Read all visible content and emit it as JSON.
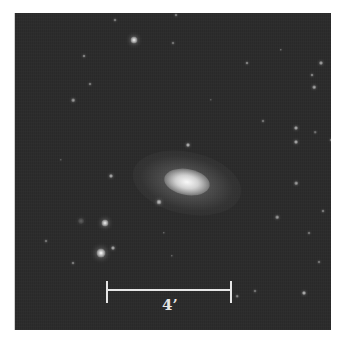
{
  "image": {
    "subject": "galaxy",
    "background_color": "#2b2b2b",
    "border_color": "#ffffff"
  },
  "scale_bar": {
    "label": "4’",
    "color": "#e6e6e6"
  },
  "galaxy": {
    "center": [
      172,
      170
    ]
  },
  "stars": [
    {
      "x": 133,
      "y": 40,
      "r": 3.5,
      "b": 0.95
    },
    {
      "x": 104,
      "y": 223,
      "r": 3.5,
      "b": 0.95
    },
    {
      "x": 100,
      "y": 253,
      "r": 4.5,
      "b": 1.0
    },
    {
      "x": 112,
      "y": 248,
      "r": 2,
      "b": 0.7
    },
    {
      "x": 158,
      "y": 202,
      "r": 2.5,
      "b": 0.85
    },
    {
      "x": 187,
      "y": 145,
      "r": 2,
      "b": 0.75
    },
    {
      "x": 114,
      "y": 20,
      "r": 1.5,
      "b": 0.5
    },
    {
      "x": 175,
      "y": 15,
      "r": 1.5,
      "b": 0.5
    },
    {
      "x": 172,
      "y": 43,
      "r": 1.5,
      "b": 0.45
    },
    {
      "x": 83,
      "y": 56,
      "r": 1.5,
      "b": 0.55
    },
    {
      "x": 89,
      "y": 84,
      "r": 1.5,
      "b": 0.5
    },
    {
      "x": 72,
      "y": 100,
      "r": 1.8,
      "b": 0.6
    },
    {
      "x": 110,
      "y": 176,
      "r": 2,
      "b": 0.7
    },
    {
      "x": 45,
      "y": 241,
      "r": 1.5,
      "b": 0.45
    },
    {
      "x": 72,
      "y": 263,
      "r": 1.5,
      "b": 0.5
    },
    {
      "x": 80,
      "y": 221,
      "r": 3,
      "b": 0.25
    },
    {
      "x": 246,
      "y": 63,
      "r": 1.5,
      "b": 0.55
    },
    {
      "x": 280,
      "y": 50,
      "r": 1.2,
      "b": 0.4
    },
    {
      "x": 320,
      "y": 63,
      "r": 2,
      "b": 0.65
    },
    {
      "x": 311,
      "y": 75,
      "r": 1.5,
      "b": 0.55
    },
    {
      "x": 313,
      "y": 87,
      "r": 1.8,
      "b": 0.65
    },
    {
      "x": 262,
      "y": 121,
      "r": 1.5,
      "b": 0.45
    },
    {
      "x": 295,
      "y": 128,
      "r": 2,
      "b": 0.7
    },
    {
      "x": 295,
      "y": 142,
      "r": 2,
      "b": 0.7
    },
    {
      "x": 314,
      "y": 132,
      "r": 1.3,
      "b": 0.4
    },
    {
      "x": 330,
      "y": 140,
      "r": 1.5,
      "b": 0.45
    },
    {
      "x": 295,
      "y": 183,
      "r": 1.8,
      "b": 0.6
    },
    {
      "x": 322,
      "y": 211,
      "r": 1.5,
      "b": 0.5
    },
    {
      "x": 276,
      "y": 217,
      "r": 1.8,
      "b": 0.6
    },
    {
      "x": 308,
      "y": 233,
      "r": 1.5,
      "b": 0.45
    },
    {
      "x": 318,
      "y": 262,
      "r": 1.5,
      "b": 0.45
    },
    {
      "x": 254,
      "y": 291,
      "r": 1.5,
      "b": 0.45
    },
    {
      "x": 303,
      "y": 293,
      "r": 2,
      "b": 0.75
    },
    {
      "x": 236,
      "y": 296,
      "r": 1.3,
      "b": 0.5
    },
    {
      "x": 171,
      "y": 256,
      "r": 1.2,
      "b": 0.35
    },
    {
      "x": 163,
      "y": 233,
      "r": 1.2,
      "b": 0.35
    },
    {
      "x": 210,
      "y": 100,
      "r": 1.2,
      "b": 0.3
    },
    {
      "x": 60,
      "y": 160,
      "r": 1.2,
      "b": 0.3
    }
  ]
}
